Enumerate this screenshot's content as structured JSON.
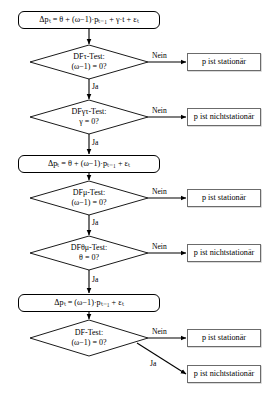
{
  "diagram": {
    "language": "de",
    "stroke_color": "#000000",
    "result_box_border": "#6b6b6b",
    "background": "#ffffff"
  },
  "equations": {
    "trend": "Δpₜ = θ + (ω−1)·pₜ₋₁ + γ·t + εₜ",
    "drift": "Δpₜ = θ + (ω−1)·pₜ₋₁ + εₜ",
    "plain": "Δpₜ = (ω−1)·pₜ₋₁ + εₜ"
  },
  "decisions": [
    {
      "id": "df-tau",
      "test_line": "DFτ-Test:",
      "test_name": "DF",
      "test_sub": "τ",
      "test_suffix": "-Test:",
      "condition": "(ω−1) = 0?",
      "no_label": "Nein",
      "yes_label": "Ja",
      "no_result": "p ist stationär"
    },
    {
      "id": "df-gamma-tau",
      "test_line": "DFγτ-Test:",
      "test_name": "DF",
      "test_sub": "γτ",
      "test_suffix": "-Test:",
      "condition": "γ = 0?",
      "no_label": "Nein",
      "yes_label": "Ja",
      "no_result": "p ist nichtstationär"
    },
    {
      "id": "df-mu",
      "test_line": "DFμ-Test:",
      "test_name": "DF",
      "test_sub": "μ",
      "test_suffix": "-Test:",
      "condition": "(ω−1) = 0?",
      "no_label": "Nein",
      "yes_label": "Ja",
      "no_result": "p ist stationär"
    },
    {
      "id": "df-theta-mu",
      "test_line": "DFθμ-Test:",
      "test_name": "DF",
      "test_sub": "θμ",
      "test_suffix": "-Test:",
      "condition": "θ = 0?",
      "no_label": "Nein",
      "yes_label": "Ja",
      "no_result": "p ist nichtstationär"
    },
    {
      "id": "df-plain",
      "test_line": "DF-Test:",
      "test_name": "DF",
      "test_sub": "",
      "test_suffix": "-Test:",
      "condition": "(ω−1) = 0?",
      "no_label": "Nein",
      "yes_label": "Ja",
      "no_result": "p ist stationär",
      "yes_result": "p ist nichtstationär"
    }
  ],
  "results": {
    "stationaer": "p ist stationär",
    "nichtstationaer": "p ist nichtstationär"
  },
  "edge_labels": {
    "nein": "Nein",
    "ja": "Ja"
  }
}
